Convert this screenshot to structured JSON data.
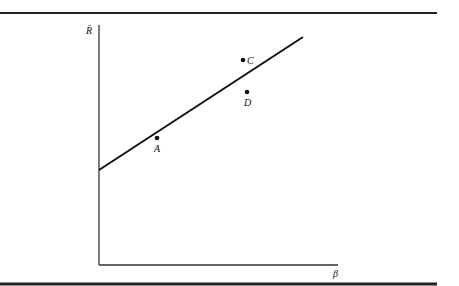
{
  "figure": {
    "y_axis_label": "R̄",
    "x_axis_label": "β",
    "points": [
      {
        "label": "A",
        "x": 157,
        "y": 138,
        "on_line": true
      },
      {
        "label": "D",
        "x": 247,
        "y": 92,
        "on_line": true
      },
      {
        "label": "C",
        "x": 243,
        "y": 60,
        "on_line": false
      }
    ],
    "line": {
      "x1": 99,
      "y1": 170,
      "x2": 303,
      "y2": 37
    },
    "colors": {
      "ink": "#111111",
      "background": "#ffffff"
    }
  }
}
